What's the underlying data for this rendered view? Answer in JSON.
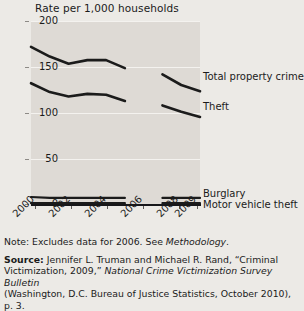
{
  "chart_data": {
    "type": "line",
    "title": "Rate per 1,000 households",
    "xlabel": "",
    "ylabel": "Rate per 1,000 households",
    "x": [
      2000,
      2001,
      2002,
      2003,
      2004,
      2005,
      2007,
      2008,
      2009
    ],
    "xtick_labels": [
      "2000",
      "2002",
      "2004",
      "2006",
      "2008",
      "2009"
    ],
    "xtick_values": [
      2000,
      2002,
      2004,
      2006,
      2008,
      2009
    ],
    "ytick_labels": [
      "0",
      "50",
      "100",
      "150",
      "200"
    ],
    "ytick_values": [
      0,
      50,
      100,
      150,
      200
    ],
    "ylim": [
      0,
      207
    ],
    "xlim": [
      2000,
      2009
    ],
    "grid": "horizontal",
    "legend_position": "right-of-lines",
    "excluded_year": 2006,
    "series": [
      {
        "name": "Total property crime",
        "label": "Total property crime",
        "x": [
          2000,
          2001,
          2002,
          2003,
          2004,
          2005,
          2007,
          2008,
          2009
        ],
        "values": [
          178,
          167,
          159,
          163,
          163,
          154,
          147,
          135,
          128
        ]
      },
      {
        "name": "Theft",
        "label": "Theft",
        "x": [
          2000,
          2001,
          2002,
          2003,
          2004,
          2005,
          2007,
          2008,
          2009
        ],
        "values": [
          137,
          127,
          122,
          125,
          124,
          117,
          112,
          105,
          99
        ]
      },
      {
        "name": "Burglary",
        "label": "Burglary",
        "x": [
          2000,
          2001,
          2002,
          2003,
          2004,
          2005,
          2007,
          2008,
          2009
        ],
        "values": [
          9,
          8,
          8,
          8,
          8,
          8,
          8,
          8,
          8
        ]
      },
      {
        "name": "Motor vehicle theft",
        "label": "Motor vehicle theft",
        "x": [
          2000,
          2001,
          2002,
          2003,
          2004,
          2005,
          2007,
          2008,
          2009
        ],
        "values": [
          2,
          2,
          2,
          2,
          2,
          2,
          2,
          2,
          2
        ]
      }
    ],
    "colors": {
      "line": "#1b1b1b",
      "plot_background": "#dedad5",
      "page_background": "#eceae6",
      "gridline": "#f4f2ef"
    }
  },
  "notes": {
    "note_label": "Note:",
    "note_text_before": " Excludes data for 2006. See ",
    "note_italic": "Methodology",
    "note_text_after": "."
  },
  "source": {
    "label": "Source:",
    "line1_after_label": " Jennifer L. Truman and Michael R. Rand, “Criminal",
    "line2_plain_start": "Victimization, 2009,” ",
    "line2_italic": "National Crime Victimization Survey Bulletin",
    "line3": "(Washington, D.C. Bureau of Justice Statistics, October 2010), p. 3."
  }
}
